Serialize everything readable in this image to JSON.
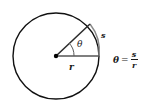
{
  "figure": {
    "colors": {
      "circle_stroke": "#111111",
      "arc_highlight": "#7a7a7a",
      "radius_stroke": "#4d4d4d",
      "angle_arc_stroke": "#5a5a5a",
      "center_dot": "#000000",
      "text": "#1a1a1a",
      "background": "#ffffff"
    },
    "geometry": {
      "center_x": 56,
      "center_y": 56,
      "radius": 43,
      "horizontal_radius_endpoint_x": 99,
      "horizontal_radius_endpoint_y": 56,
      "angled_radius_endpoint_x": 90,
      "angled_radius_endpoint_y": 24,
      "angle_degrees": 37
    },
    "labels": {
      "arc_label": "s",
      "radius_label": "r",
      "angle_label": "θ"
    },
    "equation": {
      "left": "θ",
      "operator": "=",
      "numerator": "s",
      "denominator": "r",
      "plain": "θ = s/r"
    }
  }
}
